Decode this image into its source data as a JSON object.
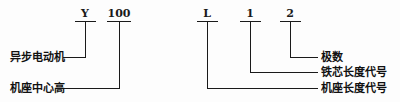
{
  "diagram": {
    "ink_color": "#1a1a1a",
    "background_color": "#fdfdfd",
    "codes": [
      {
        "id": "series",
        "text": "Y",
        "x": 85,
        "bar_x1": 75,
        "bar_x2": 96
      },
      {
        "id": "center-height",
        "text": "100",
        "x": 119,
        "bar_x1": 107,
        "bar_x2": 131
      },
      {
        "id": "frame-length",
        "text": "L",
        "x": 207,
        "bar_x1": 197,
        "bar_x2": 218
      },
      {
        "id": "core-length",
        "text": "1",
        "x": 250,
        "bar_x1": 240,
        "bar_x2": 261
      },
      {
        "id": "pole-number",
        "text": "2",
        "x": 290,
        "bar_x1": 280,
        "bar_x2": 301
      }
    ],
    "labels": {
      "left": [
        {
          "id": "asynchronous-motor",
          "text": "异步电动机",
          "row": 1
        },
        {
          "id": "frame-center-height",
          "text": "机座中心高",
          "row": 2
        }
      ],
      "right": [
        {
          "id": "pole-number",
          "text": "极数",
          "row": 1
        },
        {
          "id": "core-length-code",
          "text": "铁芯长度代号",
          "row": 2
        },
        {
          "id": "frame-length-code",
          "text": "机座长度代号",
          "row": 3
        }
      ]
    },
    "full_designation": "Y 100 L 1 - 2"
  }
}
